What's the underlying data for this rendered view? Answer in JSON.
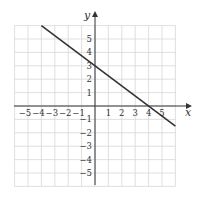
{
  "chart_data": {
    "type": "line",
    "title": "",
    "xlabel": "x",
    "ylabel": "y",
    "xlim": [
      -6,
      6
    ],
    "ylim": [
      -6,
      6
    ],
    "grid": true,
    "x_ticks": [
      "-5",
      "-4",
      "-3",
      "-2",
      "-1",
      "1",
      "2",
      "3",
      "4",
      "5"
    ],
    "y_ticks": [
      "5",
      "4",
      "3",
      "2",
      "1",
      "-1",
      "-2",
      "-3",
      "-4",
      "-5"
    ],
    "series": [
      {
        "name": "line",
        "equation": "y = -3/4 x + 3",
        "x": [
          -4,
          0,
          4,
          6
        ],
        "y": [
          6,
          3,
          0,
          -1.5
        ]
      }
    ]
  },
  "labels": {
    "x_axis": "x",
    "y_axis": "y"
  }
}
